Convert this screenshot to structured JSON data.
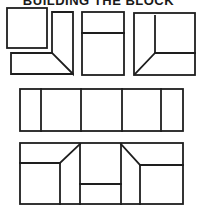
{
  "title": "BUILDING THE BLOCK",
  "colors": {
    "stroke": "#1e1e1e",
    "background": "#ffffff"
  },
  "rows": [
    {
      "name": "pieces",
      "units": [
        {
          "name": "square-piece"
        },
        {
          "name": "l-shaped-mitered-corner-pieces"
        },
        {
          "name": "two-part-rectangle-unit"
        },
        {
          "name": "mitered-corner-square-unit"
        }
      ]
    },
    {
      "name": "assembled-strip",
      "segments": 5
    },
    {
      "name": "assembled-block"
    }
  ]
}
